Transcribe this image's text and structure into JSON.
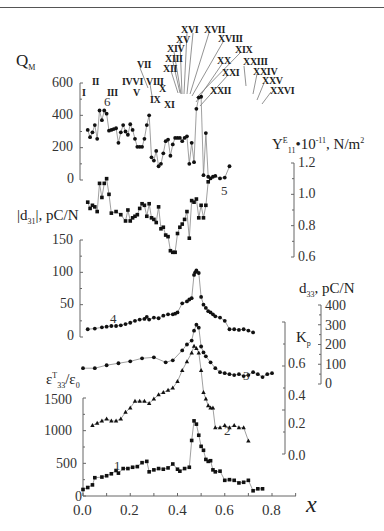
{
  "chart_data": {
    "type": "scatter",
    "title": "",
    "xlabel": "x",
    "xlim": [
      0.0,
      0.9
    ],
    "xticks": [
      "0.0",
      "0.2",
      "0.4",
      "0.6",
      "0.8"
    ],
    "panels": [
      {
        "curve": "6",
        "ylabel": "Q_M",
        "axis": "left",
        "yticks": [
          "0",
          "200",
          "400",
          "600"
        ],
        "ylim": [
          0,
          600
        ],
        "marker": "circle",
        "x": [
          0.02,
          0.03,
          0.04,
          0.05,
          0.06,
          0.07,
          0.08,
          0.09,
          0.1,
          0.11,
          0.12,
          0.13,
          0.14,
          0.15,
          0.16,
          0.17,
          0.18,
          0.19,
          0.2,
          0.21,
          0.22,
          0.23,
          0.24,
          0.25,
          0.26,
          0.27,
          0.28,
          0.29,
          0.3,
          0.31,
          0.32,
          0.33,
          0.34,
          0.35,
          0.36,
          0.37,
          0.38,
          0.39,
          0.4,
          0.41,
          0.42,
          0.43,
          0.44,
          0.45,
          0.46,
          0.47,
          0.48,
          0.49,
          0.5,
          0.51,
          0.52,
          0.53,
          0.54,
          0.55,
          0.56,
          0.58,
          0.6,
          0.62,
          0.64,
          0.66,
          0.68,
          0.7
        ],
        "values": [
          310,
          265,
          295,
          340,
          255,
          430,
          370,
          430,
          410,
          305,
          310,
          315,
          320,
          230,
          295,
          340,
          300,
          280,
          345,
          310,
          255,
          205,
          205,
          205,
          255,
          340,
          400,
          140,
          120,
          180,
          85,
          100,
          165,
          240,
          250,
          150,
          220,
          260,
          260,
          260,
          240,
          260,
          270,
          100,
          230,
          110,
          440,
          510,
          515,
          30,
          290,
          20,
          10,
          20,
          25,
          10,
          15,
          85,
          null,
          null,
          null,
          null
        ]
      },
      {
        "curve": "5",
        "ylabel": "Y11^E • 10^-11, N/m^2",
        "axis": "right",
        "yticks": [
          "0.6",
          "0.8",
          "1.0",
          "1.2"
        ],
        "ylim": [
          0.6,
          1.2
        ],
        "marker": "square",
        "x": [
          0.02,
          0.03,
          0.04,
          0.05,
          0.06,
          0.07,
          0.08,
          0.09,
          0.1,
          0.11,
          0.12,
          0.14,
          0.16,
          0.18,
          0.19,
          0.2,
          0.21,
          0.22,
          0.23,
          0.24,
          0.25,
          0.26,
          0.27,
          0.28,
          0.29,
          0.3,
          0.31,
          0.32,
          0.33,
          0.34,
          0.35,
          0.36,
          0.37,
          0.38,
          0.39,
          0.4,
          0.41,
          0.42,
          0.43,
          0.44,
          0.45,
          0.46,
          0.47,
          0.48,
          0.49,
          0.5,
          0.51,
          0.52,
          0.53,
          0.54,
          0.55,
          0.56,
          0.57,
          0.58,
          0.6,
          0.62,
          0.64,
          0.66,
          0.68,
          0.7,
          0.72
        ],
        "values": [
          0.95,
          0.91,
          0.93,
          0.92,
          0.89,
          1.07,
          0.98,
          1.07,
          1.1,
          1.0,
          0.88,
          0.89,
          0.87,
          0.83,
          0.9,
          0.83,
          0.85,
          0.86,
          0.87,
          0.91,
          0.94,
          0.93,
          0.86,
          0.94,
          0.85,
          0.84,
          0.82,
          0.92,
          0.78,
          0.79,
          0.74,
          0.73,
          0.64,
          0.63,
          0.63,
          0.75,
          0.79,
          0.81,
          0.84,
          0.89,
          0.72,
          0.96,
          0.95,
          0.97,
          0.85,
          0.93,
          0.85,
          0.93,
          1.08,
          null,
          null,
          null,
          null,
          null,
          null,
          null,
          null,
          null,
          null,
          null,
          null
        ]
      },
      {
        "curve": "4",
        "ylabel": "|d31|, pC/N",
        "axis": "left",
        "yticks": [
          "0",
          "50",
          "100",
          "150"
        ],
        "ylim": [
          0,
          150
        ],
        "marker": "circle",
        "x": [
          0.02,
          0.05,
          0.08,
          0.1,
          0.12,
          0.14,
          0.16,
          0.18,
          0.2,
          0.22,
          0.24,
          0.26,
          0.27,
          0.28,
          0.3,
          0.32,
          0.34,
          0.36,
          0.38,
          0.39,
          0.4,
          0.42,
          0.44,
          0.45,
          0.46,
          0.47,
          0.475,
          0.48,
          0.49,
          0.5,
          0.51,
          0.52,
          0.53,
          0.54,
          0.55,
          0.56,
          0.58,
          0.6,
          0.62,
          0.64,
          0.66,
          0.68,
          0.7,
          0.72
        ],
        "values": [
          12,
          13,
          15,
          16,
          17,
          17,
          18,
          20,
          22,
          25,
          27,
          28,
          31,
          27,
          30,
          29,
          33,
          35,
          35,
          36,
          38,
          52,
          55,
          58,
          60,
          96,
          100,
          103,
          99,
          62,
          50,
          45,
          40,
          38,
          35,
          32,
          30,
          25,
          12,
          12,
          11,
          12,
          10,
          7
        ]
      },
      {
        "curve": "3",
        "ylabel": "d33, pC/N",
        "axis": "right",
        "yticks": [
          "0",
          "100",
          "200",
          "300",
          "400"
        ],
        "ylim": [
          0,
          400
        ],
        "marker": "circle",
        "x": [
          0.0,
          0.05,
          0.1,
          0.15,
          0.2,
          0.25,
          0.3,
          0.35,
          0.38,
          0.42,
          0.44,
          0.46,
          0.47,
          0.48,
          0.49,
          0.5,
          0.51,
          0.52,
          0.54,
          0.56,
          0.58,
          0.6,
          0.62,
          0.64,
          0.66,
          0.68,
          0.7,
          0.72,
          0.74,
          0.76,
          0.78,
          0.8
        ],
        "values": [
          80,
          80,
          95,
          105,
          115,
          130,
          135,
          110,
          120,
          170,
          200,
          220,
          270,
          300,
          285,
          190,
          160,
          140,
          110,
          80,
          60,
          55,
          50,
          45,
          50,
          40,
          45,
          60,
          50,
          35,
          50,
          55
        ]
      },
      {
        "curve": "2",
        "ylabel": "K_p",
        "axis": "right",
        "yticks": [
          "0.0",
          "0.2",
          "0.4",
          "0.6"
        ],
        "ylim": [
          0.0,
          0.6
        ],
        "marker": "triangle",
        "x": [
          0.04,
          0.06,
          0.08,
          0.1,
          0.12,
          0.14,
          0.16,
          0.18,
          0.2,
          0.22,
          0.24,
          0.26,
          0.28,
          0.3,
          0.32,
          0.34,
          0.36,
          0.38,
          0.4,
          0.42,
          0.44,
          0.46,
          0.47,
          0.48,
          0.49,
          0.5,
          0.51,
          0.52,
          0.53,
          0.54,
          0.55,
          0.56,
          0.58,
          0.6,
          0.62,
          0.64,
          0.66,
          0.68,
          0.7,
          0.72
        ],
        "values": [
          0.13,
          0.14,
          0.15,
          0.16,
          0.15,
          0.15,
          0.16,
          0.19,
          0.21,
          0.24,
          0.24,
          0.24,
          0.23,
          0.25,
          0.27,
          0.28,
          0.29,
          0.3,
          0.33,
          0.38,
          0.42,
          0.46,
          0.49,
          0.48,
          0.46,
          0.38,
          0.28,
          0.25,
          0.22,
          0.21,
          0.21,
          0.12,
          0.12,
          0.13,
          0.12,
          0.13,
          0.12,
          0.12,
          0.06,
          null
        ]
      },
      {
        "curve": "1",
        "ylabel": "ε_33^T/ε_0",
        "axis": "left",
        "yticks": [
          "0",
          "500",
          "1000",
          "1500"
        ],
        "ylim": [
          0,
          1500
        ],
        "marker": "square",
        "x": [
          0.0,
          0.02,
          0.04,
          0.05,
          0.08,
          0.1,
          0.12,
          0.14,
          0.15,
          0.17,
          0.19,
          0.21,
          0.23,
          0.25,
          0.27,
          0.28,
          0.3,
          0.32,
          0.34,
          0.36,
          0.38,
          0.4,
          0.41,
          0.43,
          0.45,
          0.46,
          0.47,
          0.48,
          0.49,
          0.5,
          0.51,
          0.52,
          0.53,
          0.54,
          0.55,
          0.56,
          0.58,
          0.6,
          0.62,
          0.64,
          0.66,
          0.68,
          0.7,
          0.72,
          0.74,
          0.76,
          0.78,
          0.8
        ],
        "values": [
          100,
          130,
          170,
          280,
          290,
          310,
          340,
          390,
          350,
          420,
          420,
          440,
          450,
          510,
          530,
          370,
          400,
          420,
          410,
          430,
          490,
          410,
          380,
          420,
          440,
          850,
          1150,
          1100,
          930,
          760,
          700,
          560,
          530,
          540,
          400,
          370,
          380,
          240,
          250,
          240,
          200,
          210,
          240,
          80,
          110,
          110,
          null,
          null
        ]
      }
    ],
    "annotations": [
      "I",
      "II",
      "III",
      "IVVI",
      "V",
      "VII",
      "VIII",
      "IX",
      "X",
      "XI",
      "XII",
      "XIII",
      "XIV",
      "XV",
      "XVI",
      "XVII",
      "XVIII",
      "XIX",
      "XX",
      "XXI",
      "XXII",
      "XXIII",
      "XXIV",
      "XXV",
      "XXVI"
    ],
    "curve_labels": [
      "1",
      "2",
      "3",
      "4",
      "5",
      "6"
    ],
    "grid": false,
    "legend": "none"
  },
  "labels": {
    "qm": "Q",
    "qm_sub": "M",
    "y11_a": "Y",
    "y11_sup": "E",
    "y11_sub": "11",
    "y11_b": "•10",
    "y11_exp": "-11",
    "y11_c": ", N/m",
    "y11_c_sup": "2",
    "d31_a": "|d",
    "d31_sub": "31",
    "d31_b": "|, pC/N",
    "d33_a": "d",
    "d33_sub": "33",
    "d33_b": ", pC/N",
    "kp": "K",
    "kp_sub": "p",
    "eps_a": "ε",
    "eps_sup": "T",
    "eps_sub": "33",
    "eps_b": "/ε",
    "eps_sub0": "0",
    "xlabel": "x"
  },
  "ticks": {
    "qm": [
      "600",
      "400",
      "200",
      "0"
    ],
    "y11": [
      "1.2",
      "1.0",
      "0.8",
      "0.6"
    ],
    "d31": [
      "150",
      "100",
      "50",
      "0"
    ],
    "d33": [
      "400",
      "300",
      "200",
      "100",
      "0"
    ],
    "kp": [
      "0.6",
      "0.4",
      "0.2",
      "0.0"
    ],
    "eps": [
      "1500",
      "1000",
      "500",
      "0"
    ],
    "x": [
      "0.0",
      "0.2",
      "0.4",
      "0.6",
      "0.8"
    ]
  },
  "roman": {
    "r1": "I",
    "r2": "II",
    "r3": "III",
    "r4": "IVVI",
    "r5": "V",
    "r7": "VII",
    "r8": "VIII",
    "r9": "IX",
    "r10": "X",
    "r11": "XI",
    "r12": "XII",
    "r13": "XIII",
    "r14": "XIV",
    "r15": "XV",
    "r16": "XVI",
    "r17": "XVII",
    "r18": "XVIII",
    "r19": "XIX",
    "r20": "XX",
    "r21": "XXI",
    "r22": "XXII",
    "r23": "XXIII",
    "r24": "XXIV",
    "r25": "XXV",
    "r26": "XXVI"
  },
  "curve_nums": {
    "c1": "1",
    "c2": "2",
    "c3": "3",
    "c4": "4",
    "c5": "5",
    "c6": "6"
  },
  "colors": {
    "ink": "#1a1a1a",
    "line": "#777777",
    "axis": "#555555"
  }
}
